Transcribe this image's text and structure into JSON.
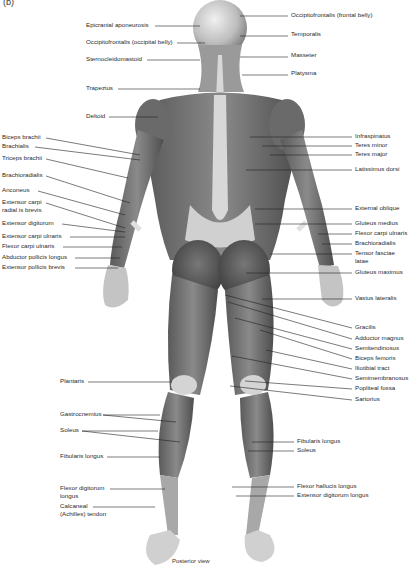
{
  "figure": {
    "panel_label": "(b)",
    "caption": "Posterior view",
    "colors": {
      "background": "#ffffff",
      "muscle_dark": "#4a4a4a",
      "muscle_mid": "#7a7a7a",
      "tendon_light": "#d8d8d8",
      "leader_line": "#222222"
    }
  },
  "labels_left": [
    {
      "text": "Epicranial aponeurosis",
      "x": 86,
      "y": 24
    },
    {
      "text": "Occipitofrontalis (occipital belly)",
      "x": 86,
      "y": 41
    },
    {
      "text": "Sternocleidomastoid",
      "x": 86,
      "y": 58
    },
    {
      "text": "Trapezius",
      "x": 86,
      "y": 87
    },
    {
      "text": "Deltoid",
      "x": 86,
      "y": 115
    },
    {
      "text": "Biceps brachii",
      "x": 2,
      "y": 136
    },
    {
      "text": "Brachialis",
      "x": 2,
      "y": 145
    },
    {
      "text": "Triceps brachii",
      "x": 2,
      "y": 157
    },
    {
      "text": "Brachioradialis",
      "x": 2,
      "y": 174
    },
    {
      "text": "Anconeus",
      "x": 2,
      "y": 189
    },
    {
      "text": "Extensor carpi",
      "x": 2,
      "y": 201
    },
    {
      "text": "radial is brevis",
      "x": 2,
      "y": 209
    },
    {
      "text": "Extensor digitorum",
      "x": 2,
      "y": 222
    },
    {
      "text": "Extensor carpi ulnaris",
      "x": 2,
      "y": 235
    },
    {
      "text": "Flexor carpi ulnaris",
      "x": 2,
      "y": 245
    },
    {
      "text": "Abductor pollicis longus",
      "x": 2,
      "y": 256
    },
    {
      "text": "Extensor pollicis brevis",
      "x": 2,
      "y": 266
    },
    {
      "text": "Plantaris",
      "x": 60,
      "y": 380
    },
    {
      "text": "Gastrocnemius",
      "x": 60,
      "y": 413
    },
    {
      "text": "Soleus",
      "x": 60,
      "y": 429
    },
    {
      "text": "Fibularis longus",
      "x": 60,
      "y": 455
    },
    {
      "text": "Flexor digitorum",
      "x": 60,
      "y": 487
    },
    {
      "text": "longus",
      "x": 60,
      "y": 495
    },
    {
      "text": "Calcaneal",
      "x": 60,
      "y": 505
    },
    {
      "text": "(Achilles) tendon",
      "x": 60,
      "y": 513
    }
  ],
  "labels_right": [
    {
      "text": "Occipitofrontalis (frontal belly)",
      "x": 291,
      "y": 14
    },
    {
      "text": "Temporalis",
      "x": 291,
      "y": 33
    },
    {
      "text": "Masseter",
      "x": 291,
      "y": 54
    },
    {
      "text": "Platysma",
      "x": 291,
      "y": 72
    },
    {
      "text": "Infraspinatus",
      "x": 355,
      "y": 135
    },
    {
      "text": "Teres minor",
      "x": 355,
      "y": 144
    },
    {
      "text": "Teres major",
      "x": 355,
      "y": 153
    },
    {
      "text": "Latissimus dorsi",
      "x": 355,
      "y": 168
    },
    {
      "text": "External oblique",
      "x": 355,
      "y": 207
    },
    {
      "text": "Gluteus medius",
      "x": 355,
      "y": 222
    },
    {
      "text": "Flexor carpi ulnaris",
      "x": 355,
      "y": 232
    },
    {
      "text": "Brachioradialis",
      "x": 355,
      "y": 242
    },
    {
      "text": "Tensor fasciae",
      "x": 355,
      "y": 252
    },
    {
      "text": "latae",
      "x": 355,
      "y": 260
    },
    {
      "text": "Gluteus maximus",
      "x": 355,
      "y": 271
    },
    {
      "text": "Vastus lateralis",
      "x": 355,
      "y": 297
    },
    {
      "text": "Gracilis",
      "x": 355,
      "y": 326
    },
    {
      "text": "Adductor magnus",
      "x": 355,
      "y": 337
    },
    {
      "text": "Semitendinosus",
      "x": 355,
      "y": 347
    },
    {
      "text": "Biceps femoris",
      "x": 355,
      "y": 357
    },
    {
      "text": "Iliotibial tract",
      "x": 355,
      "y": 367
    },
    {
      "text": "Semimembranosus",
      "x": 355,
      "y": 377
    },
    {
      "text": "Popliteal fossa",
      "x": 355,
      "y": 387
    },
    {
      "text": "Sartorius",
      "x": 355,
      "y": 398
    },
    {
      "text": "Fibularis longus",
      "x": 297,
      "y": 440
    },
    {
      "text": "Soleus",
      "x": 297,
      "y": 449
    },
    {
      "text": "Flexor hallucis longus",
      "x": 297,
      "y": 485
    },
    {
      "text": "Extensor digitorum longus",
      "x": 297,
      "y": 494
    }
  ]
}
